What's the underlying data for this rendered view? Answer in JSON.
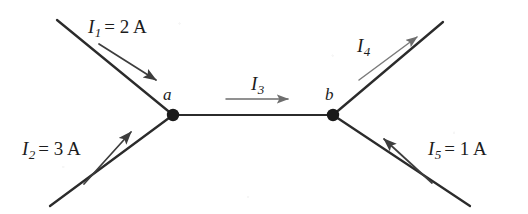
{
  "figure": {
    "kind": "current-junction-diagram",
    "background_color": "#ffffff",
    "wire_color": "#2b2b2b",
    "arrow_color": "#545454",
    "node_color": "#1a1a1a"
  },
  "nodes": [
    {
      "id": "a",
      "label": "a",
      "x": 173,
      "y": 115,
      "label_x": 163,
      "label_y": 86
    },
    {
      "id": "b",
      "label": "b",
      "x": 333,
      "y": 115,
      "label_x": 325,
      "label_y": 86
    }
  ],
  "currents": [
    {
      "id": "I1",
      "symbol": "I",
      "subscript": "1",
      "value": "2",
      "unit": "A",
      "text": "I1 = 2 A",
      "equals_value": "= 2 A",
      "direction": "into-a",
      "label_x": 88,
      "label_y": 17
    },
    {
      "id": "I2",
      "symbol": "I",
      "subscript": "2",
      "value": "3",
      "unit": "A",
      "text": "I2 = 3 A",
      "equals_value": "= 3 A",
      "direction": "into-a",
      "label_x": 22,
      "label_y": 139
    },
    {
      "id": "I3",
      "symbol": "I",
      "subscript": "3",
      "value": "",
      "unit": "",
      "text": "I3",
      "equals_value": "",
      "direction": "a-to-b",
      "label_x": 251,
      "label_y": 74
    },
    {
      "id": "I4",
      "symbol": "I",
      "subscript": "4",
      "value": "",
      "unit": "",
      "text": "I4",
      "equals_value": "",
      "direction": "out-of-b",
      "label_x": 357,
      "label_y": 36
    },
    {
      "id": "I5",
      "symbol": "I",
      "subscript": "5",
      "value": "1",
      "unit": "A",
      "text": "I5 = 1 A",
      "equals_value": "= 1 A",
      "direction": "into-b",
      "label_x": 428,
      "label_y": 139
    }
  ]
}
